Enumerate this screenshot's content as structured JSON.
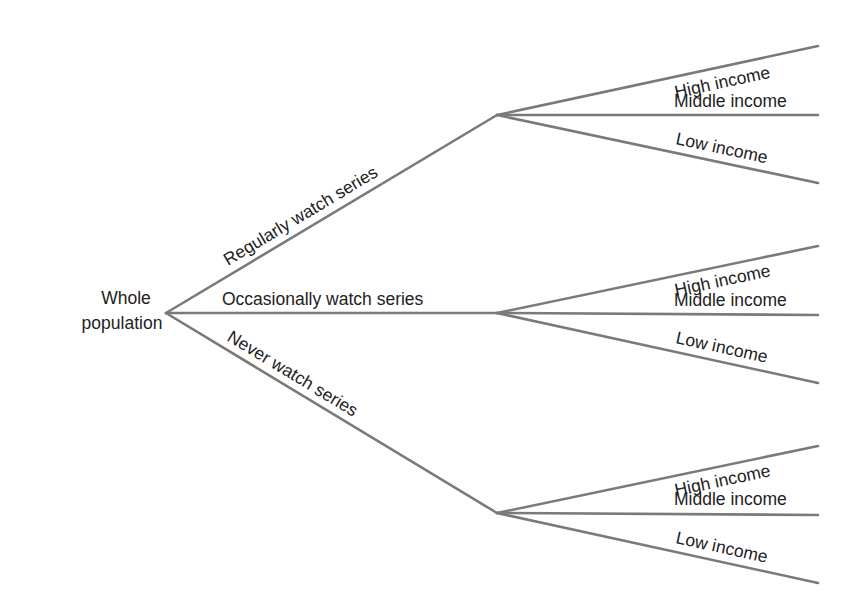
{
  "diagram": {
    "type": "tree",
    "root": {
      "label_line1": "Whole",
      "label_line2": "population"
    },
    "branches": [
      {
        "label": "Regularly watch series",
        "children": [
          "High income",
          "Middle income",
          "Low income"
        ]
      },
      {
        "label": "Occasionally watch series",
        "children": [
          "High income",
          "Middle income",
          "Low income"
        ]
      },
      {
        "label": "Never watch series",
        "children": [
          "High income",
          "Middle income",
          "Low income"
        ]
      }
    ],
    "colors": {
      "line": "#7a7a7a",
      "text": "#222222",
      "background": "#ffffff"
    }
  }
}
